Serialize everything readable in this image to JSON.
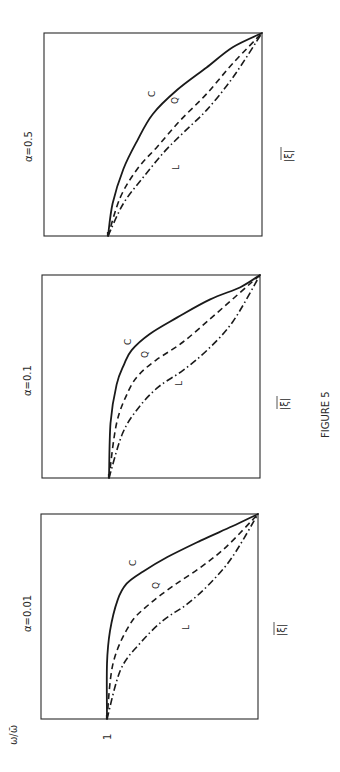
{
  "figure_label": "FIGURE 5",
  "chart_data": [
    {
      "type": "line",
      "title": "α=0.5",
      "xlabel": "|ξ|",
      "ylabel": "ω/ω̄",
      "orientation": "rotated 90° counter-clockwise",
      "xlim": [
        0,
        1
      ],
      "ylim": [
        0,
        1.44
      ],
      "y_ticks": [],
      "series": [
        {
          "name": "C",
          "style": "solid",
          "x": [
            0,
            0.16,
            0.33,
            0.47,
            0.6,
            0.72,
            0.83,
            0.93,
            1.0
          ],
          "y": [
            1.0,
            0.97,
            0.9,
            0.81,
            0.71,
            0.55,
            0.36,
            0.19,
            0.0
          ]
        },
        {
          "name": "Q",
          "style": "dashed",
          "x": [
            0,
            0.19,
            0.33,
            0.44,
            0.57,
            0.7,
            0.85,
            1.0
          ],
          "y": [
            1.0,
            0.92,
            0.81,
            0.68,
            0.53,
            0.36,
            0.19,
            0.0
          ]
        },
        {
          "name": "L",
          "style": "dash-dot",
          "x": [
            0,
            0.16,
            0.29,
            0.41,
            0.51,
            0.62,
            0.78,
            1.0
          ],
          "y": [
            1.0,
            0.9,
            0.77,
            0.64,
            0.51,
            0.36,
            0.19,
            0.0
          ]
        }
      ]
    },
    {
      "type": "line",
      "title": "α=0.1",
      "xlabel": "|ξ|",
      "ylabel": "ω/ω̄",
      "orientation": "rotated 90° counter-clockwise",
      "xlim": [
        0,
        1
      ],
      "ylim": [
        0,
        1.44
      ],
      "y_ticks": [],
      "series": [
        {
          "name": "C",
          "style": "solid",
          "x": [
            0,
            0.27,
            0.46,
            0.56,
            0.63,
            0.71,
            0.79,
            0.88,
            0.94,
            1.0
          ],
          "y": [
            1.0,
            0.99,
            0.95,
            0.9,
            0.85,
            0.73,
            0.55,
            0.33,
            0.13,
            0.0
          ]
        },
        {
          "name": "Q",
          "style": "dashed",
          "x": [
            0,
            0.27,
            0.43,
            0.51,
            0.58,
            0.67,
            0.81,
            1.0
          ],
          "y": [
            1.0,
            0.95,
            0.87,
            0.8,
            0.69,
            0.51,
            0.29,
            0.0
          ]
        },
        {
          "name": "L",
          "style": "dash-dot",
          "x": [
            0,
            0.22,
            0.35,
            0.45,
            0.53,
            0.63,
            0.77,
            1.0
          ],
          "y": [
            1.0,
            0.91,
            0.8,
            0.67,
            0.51,
            0.35,
            0.18,
            0.0
          ]
        }
      ]
    },
    {
      "type": "line",
      "title": "α=0.01",
      "xlabel": "|ξ|",
      "ylabel": "ω/ω̄",
      "orientation": "rotated 90° counter-clockwise",
      "xlim": [
        0,
        1
      ],
      "ylim": [
        0,
        1.44
      ],
      "y_ticks": [
        "1"
      ],
      "series": [
        {
          "name": "C",
          "style": "solid",
          "x": [
            0,
            0.27,
            0.43,
            0.58,
            0.66,
            0.72,
            0.79,
            0.87,
            0.94,
            1.0
          ],
          "y": [
            1.0,
            1.0,
            0.98,
            0.93,
            0.87,
            0.76,
            0.6,
            0.38,
            0.17,
            0.0
          ]
        },
        {
          "name": "Q",
          "style": "dashed",
          "x": [
            0,
            0.27,
            0.46,
            0.56,
            0.65,
            0.74,
            0.84,
            1.0
          ],
          "y": [
            1.0,
            0.96,
            0.85,
            0.72,
            0.56,
            0.38,
            0.21,
            0.0
          ]
        },
        {
          "name": "L",
          "style": "dash-dot",
          "x": [
            0,
            0.24,
            0.37,
            0.48,
            0.56,
            0.66,
            0.79,
            1.0
          ],
          "y": [
            1.0,
            0.91,
            0.78,
            0.63,
            0.47,
            0.32,
            0.17,
            0.0
          ]
        }
      ]
    }
  ]
}
